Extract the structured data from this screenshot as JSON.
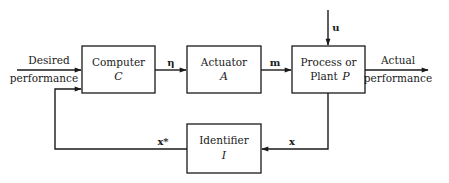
{
  "diagram": {
    "type": "block-diagram",
    "blocks": {
      "computer": {
        "label": "Computer",
        "symbol": "C"
      },
      "actuator": {
        "label": "Actuator",
        "symbol": "A"
      },
      "plant": {
        "label_line1": "Process or",
        "label_line2": "Plant ",
        "symbol": "P"
      },
      "identifier": {
        "label": "Identifier",
        "symbol": "I"
      }
    },
    "signals": {
      "input_line1": "Desired",
      "input_line2": "performance",
      "output_line1": "Actual",
      "output_line2": "performance",
      "eta": "η",
      "m": "m",
      "u": "u",
      "x": "x",
      "x_star": "x*"
    },
    "edges": [
      {
        "from": "Desired performance",
        "to": "Computer C"
      },
      {
        "from": "Computer C",
        "to": "Actuator A",
        "label": "η"
      },
      {
        "from": "Actuator A",
        "to": "Process or Plant P",
        "label": "m"
      },
      {
        "from": "u",
        "to": "Process or Plant P"
      },
      {
        "from": "Process or Plant P",
        "to": "Actual performance"
      },
      {
        "from": "Process or Plant P",
        "to": "Identifier I",
        "label": "x"
      },
      {
        "from": "Identifier I",
        "to": "Computer C",
        "label": "x*"
      }
    ]
  }
}
